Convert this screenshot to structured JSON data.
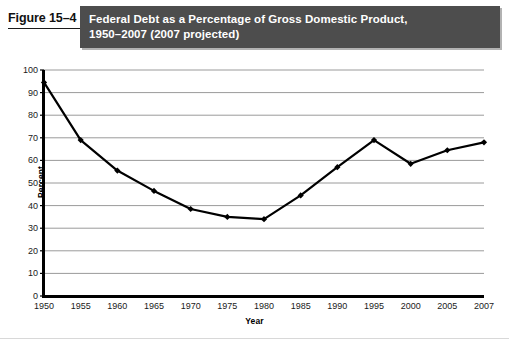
{
  "figure": {
    "label": "Figure 15–4",
    "title_line1": "Federal Debt as a Percentage of Gross Domestic Product,",
    "title_line2": "1950–2007 (2007 projected)",
    "title_bar_color": "#4d4d4d",
    "title_text_color": "#ffffff"
  },
  "chart_data": {
    "type": "line",
    "title": "Federal Debt as a Percentage of Gross Domestic Product, 1950–2007 (2007 projected)",
    "xlabel": "Year",
    "ylabel": "Percent",
    "categories": [
      "1950",
      "1955",
      "1960",
      "1965",
      "1970",
      "1975",
      "1980",
      "1985",
      "1990",
      "1995",
      "2000",
      "2005",
      "2007"
    ],
    "values": [
      94.5,
      69,
      55.5,
      46.5,
      38.5,
      35,
      34,
      44.5,
      57,
      69,
      58.5,
      64.5,
      68
    ],
    "ylim": [
      0,
      100
    ],
    "ytick_step": 10,
    "yticks": [
      "0",
      "10",
      "20",
      "30",
      "40",
      "50",
      "60",
      "70",
      "80",
      "90",
      "100"
    ],
    "grid": true,
    "grid_axis": "y",
    "legend": "none",
    "series_color": "#000000",
    "marker": "diamond",
    "gridline_color": "#9a9a9a",
    "axis_color": "#000000"
  }
}
